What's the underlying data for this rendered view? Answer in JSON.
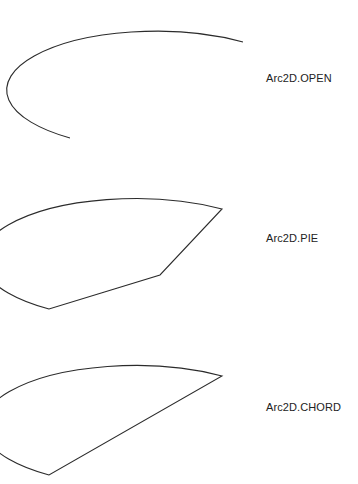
{
  "figure": {
    "background_color": "#ffffff",
    "stroke_color": "#2b2b2b",
    "text_color": "#222222",
    "width": 358,
    "height": 484
  },
  "diagram_data": {
    "type": "vector-shapes",
    "description": "Three renderings of the same elliptical arc using different Arc2D closure types",
    "arc_geometry": {
      "center_x": 160,
      "center_y": 75,
      "radius_x": 135,
      "radius_y": 53,
      "start_angle_deg": -10,
      "extent_deg": 250,
      "direction": "counterclockwise"
    },
    "items": [
      {
        "id": "open",
        "label": "Arc2D.OPEN",
        "closure": "OPEN",
        "filled": false,
        "note": "arc curve only, endpoints not connected",
        "path": "M 243 42 A 135 53 0 1 0 70 138"
      },
      {
        "id": "pie",
        "label": "Arc2D.PIE",
        "closure": "PIE",
        "filled": false,
        "note": "arc closed by two radius segments to the center point",
        "center_point": [
          160,
          105
        ],
        "path": "M 222 39 A 135 53 0 1 0 49 139 L 160 105 Z"
      },
      {
        "id": "chord",
        "label": "Arc2D.CHORD",
        "closure": "CHORD",
        "filled": false,
        "note": "arc closed by a straight chord between the two endpoints",
        "path": "M 222 44 A 135 53 0 1 0 49 143 Z"
      }
    ]
  },
  "labels": {
    "open": "Arc2D.OPEN",
    "pie": "Arc2D.PIE",
    "chord": "Arc2D.CHORD"
  }
}
